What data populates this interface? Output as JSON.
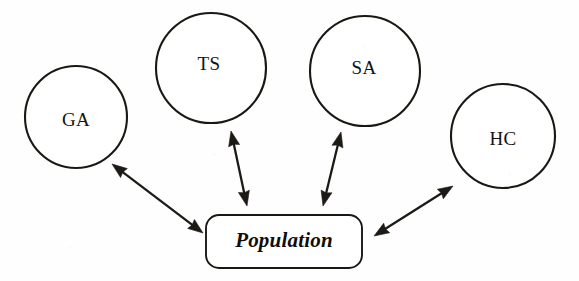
{
  "diagram": {
    "type": "node-link",
    "background_color": "#ffffff",
    "stroke_color": "#1b1814",
    "nodes": [
      {
        "id": "ga",
        "label": "GA",
        "shape": "circle",
        "cx": 76,
        "cy": 117,
        "r": 51,
        "label_x": 76,
        "label_y": 122
      },
      {
        "id": "ts",
        "label": "TS",
        "shape": "circle",
        "cx": 211,
        "cy": 68,
        "r": 55,
        "label_x": 209,
        "label_y": 66
      },
      {
        "id": "sa",
        "label": "SA",
        "shape": "circle",
        "cx": 365,
        "cy": 71,
        "r": 55,
        "label_x": 364,
        "label_y": 70
      },
      {
        "id": "hc",
        "label": "HC",
        "shape": "circle",
        "cx": 503,
        "cy": 136,
        "r": 52,
        "label_x": 503,
        "label_y": 141
      }
    ],
    "center": {
      "id": "population",
      "label": "Population",
      "shape": "rounded-rect",
      "x": 206,
      "y": 215,
      "width": 156,
      "height": 53,
      "corner_radius": 13,
      "label_x": 284,
      "label_y": 242
    },
    "edges": [
      {
        "id": "edge-ga-population",
        "from": "ga",
        "to": "population",
        "style": "double-arrow",
        "x1": 112,
        "y1": 164,
        "x2": 203,
        "y2": 233
      },
      {
        "id": "edge-ts-population",
        "from": "ts",
        "to": "population",
        "style": "double-arrow",
        "x1": 231,
        "y1": 131,
        "x2": 247,
        "y2": 206
      },
      {
        "id": "edge-sa-population",
        "from": "sa",
        "to": "population",
        "style": "double-arrow",
        "x1": 341,
        "y1": 132,
        "x2": 323,
        "y2": 206
      },
      {
        "id": "edge-hc-population",
        "from": "hc",
        "to": "population",
        "style": "double-arrow",
        "x1": 374,
        "y1": 236,
        "x2": 453,
        "y2": 186
      }
    ]
  }
}
